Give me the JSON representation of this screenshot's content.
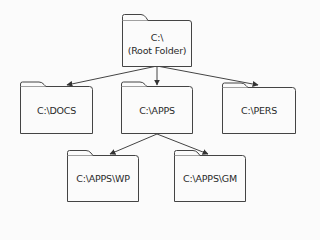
{
  "diagram": {
    "type": "directory-tree",
    "colors": {
      "background": "#fbfbfb",
      "stroke": "#444444",
      "text": "#2a2a2a"
    },
    "nodes": [
      {
        "id": "root",
        "line1": "C:\\",
        "line2": "(Root Folder)",
        "x": 122,
        "y": 20,
        "w": 69,
        "h": 46
      },
      {
        "id": "docs",
        "line1": "C:\\DOCS",
        "line2": "",
        "x": 20,
        "y": 86,
        "w": 72,
        "h": 47
      },
      {
        "id": "apps",
        "line1": "C:\\APPS",
        "line2": "",
        "x": 121,
        "y": 86,
        "w": 71,
        "h": 47
      },
      {
        "id": "pers",
        "line1": "C:\\PERS",
        "line2": "",
        "x": 222,
        "y": 87,
        "w": 73,
        "h": 46
      },
      {
        "id": "wp",
        "line1": "C:\\APPS\\WP",
        "line2": "",
        "x": 67,
        "y": 155,
        "w": 71,
        "h": 46
      },
      {
        "id": "gm",
        "line1": "C:\\APPS\\GM",
        "line2": "",
        "x": 174,
        "y": 155,
        "w": 71,
        "h": 46
      }
    ],
    "edges": [
      {
        "from": "root",
        "to": "docs"
      },
      {
        "from": "root",
        "to": "apps"
      },
      {
        "from": "root",
        "to": "pers"
      },
      {
        "from": "apps",
        "to": "wp"
      },
      {
        "from": "apps",
        "to": "gm"
      }
    ]
  }
}
